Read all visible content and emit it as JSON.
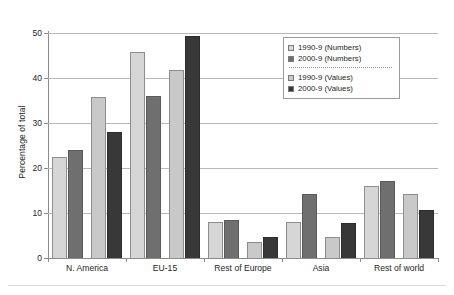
{
  "chart_data": {
    "type": "bar",
    "title": "",
    "xlabel": "",
    "ylabel": "Percentage of total",
    "ylim": [
      0,
      50
    ],
    "yticks": [
      0,
      10,
      20,
      30,
      40,
      50
    ],
    "ytick_labels": [
      "0",
      "10",
      "20",
      "30",
      "40",
      "50"
    ],
    "grid": true,
    "legend_position": "top-right",
    "categories": [
      "N. America",
      "EU-15",
      "Rest of Europe",
      "Asia",
      "Rest of world"
    ],
    "series": [
      {
        "name": "1990-9 (Numbers)",
        "color": "#d6d6d6",
        "values": [
          22.4,
          45.7,
          8.1,
          8.0,
          15.9
        ]
      },
      {
        "name": "2000-9 (Numbers)",
        "color": "#6f6f6f",
        "values": [
          24.1,
          35.9,
          8.5,
          14.2,
          17.2
        ]
      },
      {
        "name": "1990-9 (Values)",
        "color": "#c9c9c9",
        "values": [
          35.7,
          41.7,
          3.5,
          4.6,
          14.2
        ]
      },
      {
        "name": "2000-9 (Values)",
        "color": "#383838",
        "values": [
          27.9,
          49.3,
          4.6,
          7.7,
          10.7
        ]
      }
    ]
  },
  "legend": {
    "items": [
      {
        "label": "1990-9 (Numbers)"
      },
      {
        "label": "2000-9 (Numbers)"
      },
      {
        "label": "1990-9 (Values)"
      },
      {
        "label": "2000-9 (Values)"
      }
    ]
  }
}
